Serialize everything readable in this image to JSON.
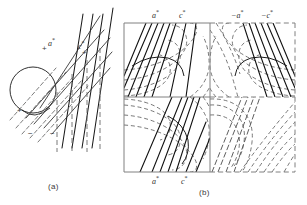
{
  "figure": {
    "title": "",
    "background_color": "#ffffff",
    "line_color_solid": "#1a1a1a",
    "line_color_dashed": "#555555",
    "box_color": "#777777",
    "width": 307,
    "height": 205
  },
  "panel_a": {
    "caption": "(a)",
    "labels": [
      {
        "text": "a*",
        "base": "a",
        "star": "*"
      },
      {
        "text": "c*",
        "base": "c",
        "star": "*"
      }
    ],
    "signs": [
      "+",
      "+",
      "+",
      "−",
      "−"
    ],
    "circle": {
      "cx": 33,
      "cy": 90,
      "r": 23
    },
    "description": "Ewald sphere construction with reciprocal lattice rows and dashed traces"
  },
  "panel_b": {
    "caption": "(b)",
    "labels_top": [
      {
        "text": "a*",
        "base": "a",
        "star": "*"
      },
      {
        "text": "c*",
        "base": "c",
        "star": "*"
      },
      {
        "text": "-a*",
        "base": "−a",
        "star": "*"
      },
      {
        "text": "-c*",
        "base": "−c",
        "star": "*"
      }
    ],
    "labels_bottom": [
      {
        "text": "a*",
        "base": "a",
        "star": "*"
      },
      {
        "text": "c*",
        "base": "c",
        "star": "*"
      }
    ],
    "grid": {
      "x0": 124,
      "y0": 23,
      "x1": 295,
      "y1": 172,
      "xmid": 210,
      "ymid": 97
    },
    "quadrants": [
      {
        "name": "top-left",
        "border": "solid",
        "contours": "dashed-nested-loops",
        "rays": "solid"
      },
      {
        "name": "top-right",
        "border": "dashed",
        "contours": "dashed-nested-loops",
        "rays": "solid"
      },
      {
        "name": "bottom-left",
        "border": "solid",
        "contours": "dashed-nested-loops",
        "rays": "solid"
      },
      {
        "name": "bottom-right",
        "border": "dashed",
        "contours": "dashed-nested-loops",
        "rays": "dashed"
      }
    ],
    "description": "Four-quadrant reciprocal space map, mirrored contour families"
  }
}
